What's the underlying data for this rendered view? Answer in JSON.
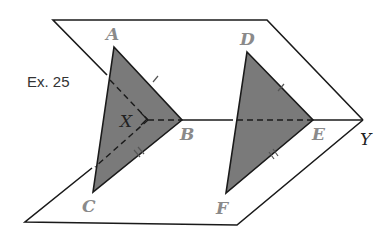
{
  "caption": "Ex. 25",
  "labels": {
    "A": "A",
    "B": "B",
    "C": "C",
    "X": "X",
    "D": "D",
    "E": "E",
    "F": "F",
    "Y": "Y"
  },
  "colors": {
    "triangle_fill": "#7a7a7a",
    "line": "#1a1a1a",
    "label_gray": "#8a8a8a"
  }
}
